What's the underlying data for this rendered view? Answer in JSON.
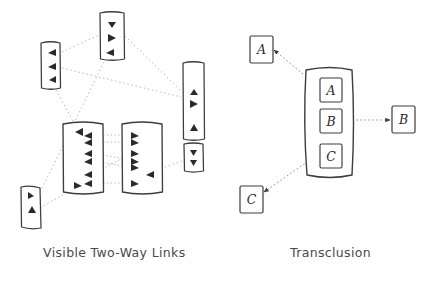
{
  "figure": {
    "background_color": "#ffffff",
    "ink_color": "#3c3c3c",
    "link_color": "#b4b4b4",
    "caption_color": "#4a4a4a",
    "panels": [
      {
        "id": "visible-two-way-links",
        "caption": "Visible Two-Way Links",
        "documents": [
          {
            "id": "doc-top-center",
            "x": 100,
            "y": 12,
            "w": 24,
            "h": 48,
            "markers": 3,
            "marker_dir": "down"
          },
          {
            "id": "doc-upper-left",
            "x": 40,
            "y": 42,
            "w": 20,
            "h": 46,
            "markers": 3,
            "marker_dir": "left"
          },
          {
            "id": "doc-right-tall",
            "x": 182,
            "y": 62,
            "w": 22,
            "h": 78,
            "markers": 3,
            "marker_dir": "up"
          },
          {
            "id": "doc-center-left",
            "x": 62,
            "y": 122,
            "w": 42,
            "h": 72,
            "markers": 7,
            "marker_dir": "left"
          },
          {
            "id": "doc-center-right",
            "x": 122,
            "y": 122,
            "w": 40,
            "h": 72,
            "markers": 7,
            "marker_dir": "right"
          },
          {
            "id": "doc-right-small",
            "x": 183,
            "y": 143,
            "w": 20,
            "h": 28,
            "markers": 2,
            "marker_dir": "down"
          },
          {
            "id": "doc-lower-left",
            "x": 20,
            "y": 186,
            "w": 20,
            "h": 42,
            "markers": 2,
            "marker_dir": "up"
          }
        ]
      },
      {
        "id": "transclusion",
        "caption": "Transclusion",
        "outer_boxes": [
          {
            "id": "ext-box-a",
            "label": "A",
            "x": 250,
            "y": 36,
            "w": 22,
            "h": 26
          },
          {
            "id": "ext-box-b",
            "label": "B",
            "x": 392,
            "y": 104,
            "w": 22,
            "h": 26
          },
          {
            "id": "ext-box-c",
            "label": "C",
            "x": 240,
            "y": 186,
            "w": 22,
            "h": 26
          }
        ],
        "container": {
          "id": "transclusion-document",
          "x": 305,
          "y": 68,
          "w": 48,
          "h": 108
        },
        "inner_boxes": [
          {
            "id": "inner-box-a",
            "label": "A",
            "x": 320,
            "y": 78,
            "w": 22,
            "h": 24
          },
          {
            "id": "inner-box-b",
            "label": "B",
            "x": 320,
            "y": 110,
            "w": 22,
            "h": 24
          },
          {
            "id": "inner-box-c",
            "label": "C",
            "x": 320,
            "y": 145,
            "w": 22,
            "h": 24
          }
        ]
      }
    ]
  }
}
